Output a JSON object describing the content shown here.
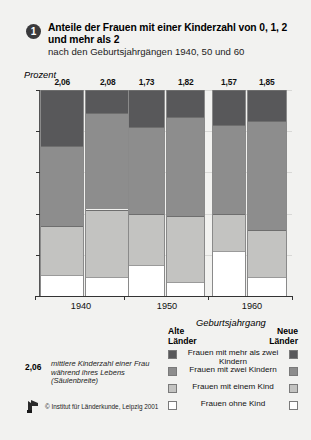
{
  "header": {
    "badge": "1",
    "title": "Anteile der Frauen mit einer Kinderzahl von 0, 1, 2 und mehr als 2",
    "subtitle": "nach den Geburtsjahrgängen 1940, 50 und 60"
  },
  "axis": {
    "ylabel": "Prozent",
    "xlabel": "Geburtsjahrgang",
    "yticks": [
      "0",
      "20",
      "40",
      "60",
      "80",
      "100"
    ]
  },
  "legend": {
    "group_left": "Alte\nLänder",
    "group_left_line1": "Alte",
    "group_left_line2": "Länder",
    "group_right_line1": "Neue",
    "group_right_line2": "Länder",
    "entries": [
      {
        "label": "Frauen mit mehr als zwei Kindern",
        "color": "#58585a"
      },
      {
        "label": "Frauen mit zwei Kindern",
        "color": "#8d8d8d"
      },
      {
        "label": "Frauen mit einem Kind",
        "color": "#c3c3c1"
      },
      {
        "label": "Frauen ohne Kind",
        "color": "#ffffff"
      }
    ]
  },
  "footnote": {
    "number": "2,06",
    "text": "mittlere Kinderzahl einer Frau während ihres Lebens (Säulenbreite)",
    "copyright": "© Institut für Länderkunde, Leipzig 2001"
  },
  "chart_data": {
    "type": "bar",
    "title": "Anteile der Frauen mit einer Kinderzahl von 0, 1, 2 und mehr als 2",
    "subtitle": "nach den Geburtsjahrgängen 1940, 50 und 60",
    "xlabel": "Geburtsjahrgang",
    "ylabel": "Prozent",
    "ylim": [
      0,
      100
    ],
    "grid": true,
    "stacked": true,
    "legend_position": "bottom-right",
    "categories": [
      "1940",
      "1950",
      "1960"
    ],
    "subgroups": [
      "Alte Länder",
      "Neue Länder"
    ],
    "series": [
      {
        "name": "Frauen ohne Kind",
        "color": "#ffffff",
        "values": [
          [
            10,
            9
          ],
          [
            15,
            7
          ],
          [
            22,
            9
          ]
        ]
      },
      {
        "name": "Frauen mit einem Kind",
        "color": "#c3c3c1",
        "values": [
          [
            24,
            33
          ],
          [
            25,
            32
          ],
          [
            18,
            23
          ]
        ]
      },
      {
        "name": "Frauen mit zwei Kindern",
        "color": "#8d8d8d",
        "values": [
          [
            39,
            47
          ],
          [
            42,
            48
          ],
          [
            43,
            53
          ]
        ]
      },
      {
        "name": "Frauen mit mehr als zwei Kindern",
        "color": "#58585a",
        "values": [
          [
            27,
            11
          ],
          [
            18,
            13
          ],
          [
            17,
            15
          ]
        ]
      }
    ],
    "bar_width_values": {
      "description": "mittlere Kinderzahl einer Frau während ihres Lebens (Säulenbreite)",
      "labels": [
        [
          "2,06",
          "2,08"
        ],
        [
          "1,73",
          "1,82"
        ],
        [
          "1,57",
          "1,85"
        ]
      ],
      "numbers": [
        [
          2.06,
          2.08
        ],
        [
          1.73,
          1.82
        ],
        [
          1.57,
          1.85
        ]
      ]
    }
  }
}
